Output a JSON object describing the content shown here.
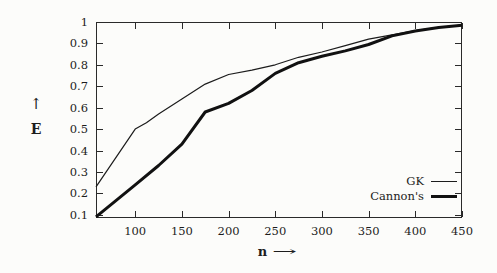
{
  "colors": {
    "background": "#fcfcfa",
    "ink": "#1c1c1c",
    "frame": "#2a2a2a"
  },
  "chart_data": {
    "type": "line",
    "title": "",
    "xlabel": {
      "letter": "n",
      "arrow": "→"
    },
    "ylabel": {
      "letter": "E",
      "arrow": "↑"
    },
    "xlim": [
      58,
      450
    ],
    "ylim": [
      0.085,
      1.0
    ],
    "grid": false,
    "frame": "box with inward mirrored ticks on all four sides",
    "legend_position": "inside bottom-right",
    "x_ticks": [
      {
        "value": 100,
        "label": "100"
      },
      {
        "value": 150,
        "label": "150"
      },
      {
        "value": 200,
        "label": "200"
      },
      {
        "value": 250,
        "label": "250"
      },
      {
        "value": 300,
        "label": "300"
      },
      {
        "value": 350,
        "label": "350"
      },
      {
        "value": 400,
        "label": "400"
      },
      {
        "value": 450,
        "label": "450"
      }
    ],
    "y_ticks": [
      {
        "value": 0.1,
        "label": "0.1"
      },
      {
        "value": 0.2,
        "label": "0.2"
      },
      {
        "value": 0.3,
        "label": "0.3"
      },
      {
        "value": 0.4,
        "label": "0.4"
      },
      {
        "value": 0.5,
        "label": "0.5"
      },
      {
        "value": 0.6,
        "label": "0.6"
      },
      {
        "value": 0.7,
        "label": "0.7"
      },
      {
        "value": 0.8,
        "label": "0.8"
      },
      {
        "value": 0.9,
        "label": "0.9"
      },
      {
        "value": 1.0,
        "label": "1"
      }
    ],
    "series": [
      {
        "name": "GK",
        "color": "#1c1c1c",
        "line_width": 1.2,
        "x": [
          58,
          100,
          112,
          125,
          150,
          175,
          200,
          225,
          250,
          275,
          300,
          325,
          350,
          375,
          400,
          425,
          450
        ],
        "y": [
          0.23,
          0.5,
          0.53,
          0.57,
          0.64,
          0.71,
          0.755,
          0.775,
          0.8,
          0.835,
          0.86,
          0.89,
          0.92,
          0.94,
          0.96,
          0.975,
          0.985
        ]
      },
      {
        "name": "Cannon's",
        "color": "#111111",
        "line_width": 3,
        "x": [
          58,
          100,
          125,
          150,
          175,
          200,
          225,
          250,
          275,
          300,
          325,
          350,
          375,
          400,
          425,
          450
        ],
        "y": [
          0.09,
          0.24,
          0.33,
          0.43,
          0.58,
          0.62,
          0.68,
          0.76,
          0.81,
          0.84,
          0.865,
          0.895,
          0.935,
          0.958,
          0.974,
          0.985
        ]
      }
    ]
  }
}
